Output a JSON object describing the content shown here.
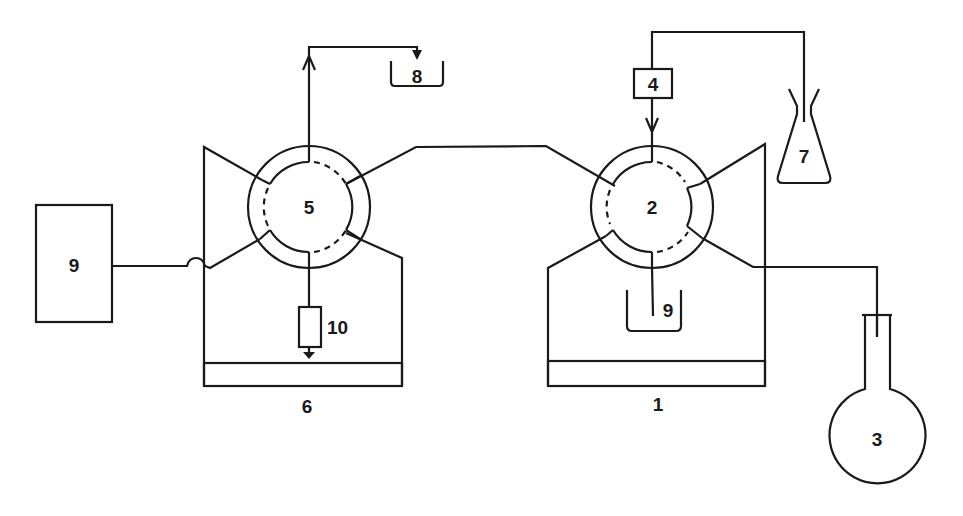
{
  "diagram": {
    "type": "flow-injection apparatus schematic",
    "colors": {
      "line": "#1a1a1a",
      "background": "#ffffff"
    },
    "components": [
      {
        "id": "1",
        "label": "1",
        "shape": "pump-stand",
        "description": "stand under valve 2"
      },
      {
        "id": "2",
        "label": "2",
        "shape": "rotary-valve"
      },
      {
        "id": "3",
        "label": "3",
        "shape": "round-bottom-flask"
      },
      {
        "id": "4",
        "label": "4",
        "shape": "box"
      },
      {
        "id": "5",
        "label": "5",
        "shape": "rotary-valve"
      },
      {
        "id": "6",
        "label": "6",
        "shape": "pump-stand",
        "description": "stand under valve 5"
      },
      {
        "id": "7",
        "label": "7",
        "shape": "erlenmeyer-flask"
      },
      {
        "id": "8a",
        "label": "8",
        "shape": "waste-beaker",
        "position": "top, outlet of valve 5"
      },
      {
        "id": "8b",
        "label": "8",
        "shape": "waste-beaker",
        "position": "below valve 2"
      },
      {
        "id": "9",
        "label": "9",
        "shape": "box"
      },
      {
        "id": "10",
        "label": "10",
        "shape": "column-with-ground"
      }
    ],
    "connections": [
      {
        "from": "7",
        "to": "4"
      },
      {
        "from": "4",
        "to": "2",
        "arrow": true
      },
      {
        "from": "2",
        "to": "8b"
      },
      {
        "from": "2",
        "to": "3"
      },
      {
        "from": "2",
        "to": "5"
      },
      {
        "from": "5",
        "to": "8a",
        "arrow": true
      },
      {
        "from": "5",
        "to": "10"
      },
      {
        "from": "9",
        "to": "5",
        "crossover": true
      }
    ]
  }
}
